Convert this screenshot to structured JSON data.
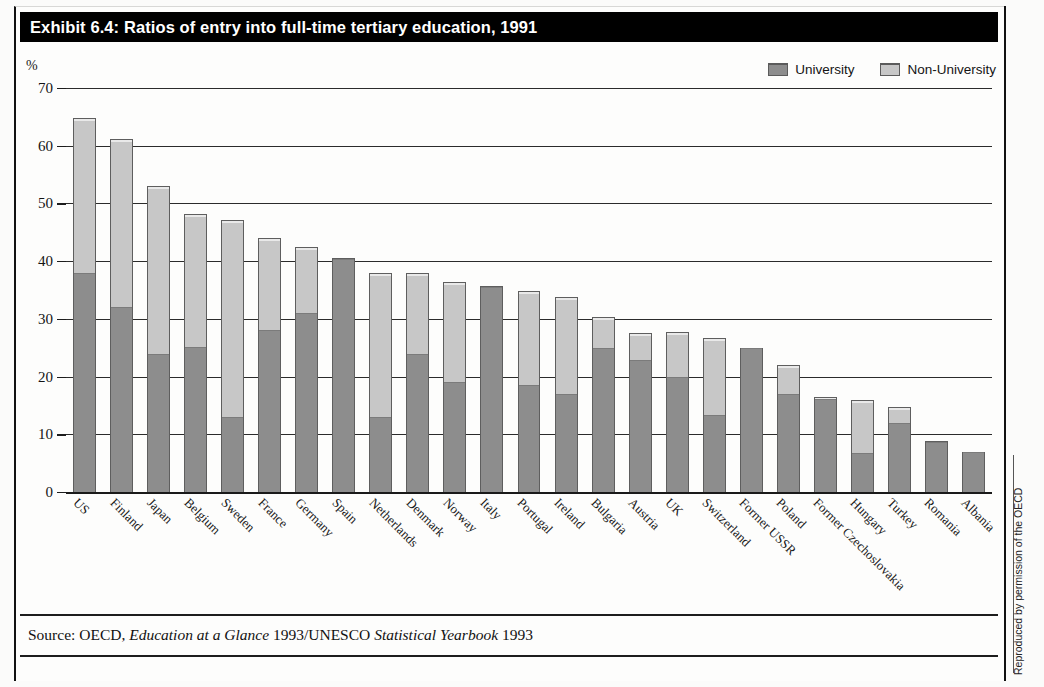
{
  "title": "Exhibit 6.4: Ratios of entry into full-time tertiary education, 1991",
  "axis_unit": "%",
  "legend": [
    {
      "label": "University",
      "color": "#8d8d8d",
      "icon": "legend-swatch-university"
    },
    {
      "label": "Non-University",
      "color": "#c7c7c7",
      "icon": "legend-swatch-non-university"
    }
  ],
  "source": {
    "prefix": "Source: OECD, ",
    "italic1": "Education at a Glance",
    "mid": " 1993/UNESCO ",
    "italic2": "Statistical Yearbook",
    "suffix": " 1993"
  },
  "credit": "Reproduced by permission of the OECD",
  "chart_data": {
    "type": "bar",
    "subtype": "stacked-bar",
    "title": "Exhibit 6.4: Ratios of entry into full-time tertiary education, 1991",
    "xlabel": "",
    "ylabel": "%",
    "ylim": [
      0,
      70
    ],
    "yticks": [
      0,
      10,
      20,
      30,
      40,
      50,
      60,
      70
    ],
    "grid": true,
    "legend_position": "top-right",
    "categories": [
      "US",
      "Finland",
      "Japan",
      "Belgium",
      "Sweden",
      "France",
      "Germany",
      "Spain",
      "Netherlands",
      "Denmark",
      "Norway",
      "Italy",
      "Portugal",
      "Ireland",
      "Bulgaria",
      "Austria",
      "UK",
      "Switzerland",
      "Former USSR",
      "Poland",
      "Former Czechoslovakia",
      "Hungary",
      "Turkey",
      "Romania",
      "Albania"
    ],
    "series": [
      {
        "name": "University",
        "color": "#8d8d8d",
        "values": [
          38,
          32,
          24,
          25.2,
          13,
          28,
          31,
          40.3,
          13,
          24,
          19,
          35.5,
          18.6,
          17,
          25,
          22.8,
          20,
          13.4,
          25,
          17,
          16.2,
          6.8,
          12,
          8.6,
          7
        ]
      },
      {
        "name": "Non-University",
        "color": "#c7c7c7",
        "values": [
          26.8,
          29.2,
          29,
          23,
          34.2,
          16,
          11.5,
          0.2,
          25,
          14,
          17.4,
          0.2,
          16.3,
          16.8,
          5.3,
          4.8,
          7.7,
          13.2,
          0,
          5,
          0.2,
          9.2,
          2.7,
          0.2,
          0
        ]
      }
    ],
    "totals": [
      64.8,
      61.2,
      53,
      48.2,
      47.2,
      44,
      42.5,
      40.5,
      38,
      38,
      36.4,
      35.7,
      34.9,
      33.8,
      30.3,
      27.6,
      27.7,
      26.6,
      25,
      22,
      16.4,
      16,
      14.7,
      8.8,
      7
    ]
  }
}
